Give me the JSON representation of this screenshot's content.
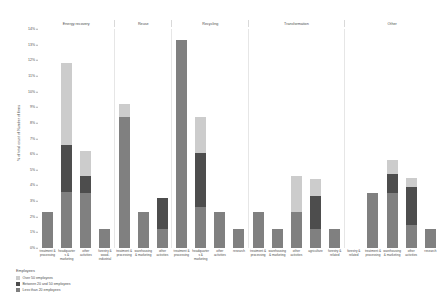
{
  "chart_data": {
    "type": "bar",
    "title": "",
    "subtitle": "",
    "xlabel": "",
    "ylabel": "% of total count of Number of firms",
    "ylim": [
      0,
      14
    ],
    "ytick_labels": [
      "14%",
      "13%",
      "12%",
      "11%",
      "10%",
      "9%",
      "8%",
      "7%",
      "6%",
      "5%",
      "4%",
      "3%",
      "2%",
      "1%",
      "0%"
    ],
    "ytick_values": [
      14,
      13,
      12,
      11,
      10,
      9,
      8,
      7,
      6,
      5,
      4,
      3,
      2,
      1,
      0
    ],
    "grid": false,
    "legend_position": "bottom-left",
    "stacked": true,
    "facet_variable": "Treatment type",
    "series": [
      {
        "name": "Over 50 employees",
        "color": "#cccccc"
      },
      {
        "name": "Between 20 and 50 employees",
        "color": "#4d4d4d"
      },
      {
        "name": "Less than 20 employees",
        "color": "#808080"
      }
    ],
    "facets": [
      {
        "label": "Energy recovery",
        "categories": [
          "treatment & processing",
          "headquarters & marketing",
          "other activities",
          "forestry & wood-industrial"
        ],
        "values": {
          "Over 50 employees": [
            0.0,
            5.2,
            1.6,
            0.0
          ],
          "Between 20 and 50 employees": [
            0.0,
            3.0,
            1.1,
            0.0
          ],
          "Less than 20 employees": [
            2.3,
            3.6,
            3.5,
            1.2
          ]
        }
      },
      {
        "label": "Reuse",
        "categories": [
          "treatment & processing",
          "warehousing & marketing",
          "other activities"
        ],
        "values": {
          "Over 50 employees": [
            0.8,
            0.0,
            0.0
          ],
          "Between 20 and 50 employees": [
            0.0,
            0.0,
            2.0
          ],
          "Less than 20 employees": [
            8.4,
            2.3,
            1.2
          ]
        }
      },
      {
        "label": "Recycling",
        "categories": [
          "treatment & processing",
          "headquarters & marketing",
          "other activities",
          "research"
        ],
        "values": {
          "Over 50 employees": [
            0.0,
            2.3,
            0.0,
            0.0
          ],
          "Between 20 and 50 employees": [
            0.0,
            3.5,
            0.0,
            0.0
          ],
          "Less than 20 employees": [
            13.3,
            2.6,
            2.3,
            1.2
          ]
        }
      },
      {
        "label": "Transformation",
        "categories": [
          "treatment & processing",
          "warehousing & marketing",
          "other activities",
          "agriculture",
          "forestry & related"
        ],
        "values": {
          "Over 50 employees": [
            0.0,
            0.0,
            2.3,
            1.1,
            0.0
          ],
          "Between 20 and 50 employees": [
            0.0,
            0.0,
            0.0,
            2.1,
            0.0
          ],
          "Less than 20 employees": [
            2.3,
            1.2,
            2.3,
            1.2,
            1.2
          ]
        }
      },
      {
        "label": "Other",
        "categories": [
          "forestry & related",
          "treatment & processing",
          "warehousing & marketing",
          "other activities",
          "research"
        ],
        "values": {
          "Over 50 employees": [
            0.0,
            0.0,
            0.9,
            0.6,
            0.0
          ],
          "Between 20 and 50 employees": [
            0.0,
            0.0,
            1.2,
            2.4,
            0.0
          ],
          "Less than 20 employees": [
            0.0,
            3.5,
            3.5,
            1.5,
            1.2
          ]
        }
      }
    ]
  },
  "legend": {
    "title": "Employees",
    "items": [
      {
        "label": "Over 50 employees",
        "color": "#cccccc"
      },
      {
        "label": "Between 20 and 50 employees",
        "color": "#4d4d4d"
      },
      {
        "label": "Less than 20 employees",
        "color": "#808080"
      }
    ]
  }
}
